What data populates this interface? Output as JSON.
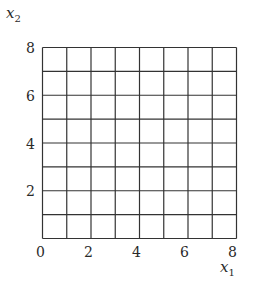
{
  "diagram": {
    "type": "grid",
    "x_axis": {
      "label": "x",
      "subscript": "1",
      "ticks": [
        "0",
        "2",
        "4",
        "6",
        "8"
      ],
      "min": 0,
      "max": 8
    },
    "y_axis": {
      "label": "x",
      "subscript": "2",
      "ticks": [
        "2",
        "4",
        "6",
        "8"
      ],
      "min": 0,
      "max": 8
    },
    "cells_x": 8,
    "cells_y": 8,
    "line_color": "#333333"
  }
}
